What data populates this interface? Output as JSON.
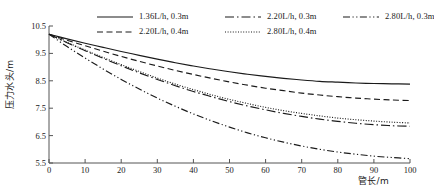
{
  "chart_data": {
    "type": "line",
    "title": "",
    "xlabel": "管长/m",
    "ylabel": "压力水头/m",
    "xlim": [
      0,
      100
    ],
    "ylim": [
      5.5,
      10.5
    ],
    "xticks": [
      0,
      10,
      20,
      30,
      40,
      50,
      60,
      70,
      80,
      90,
      100
    ],
    "yticks": [
      "10.5",
      "9.5",
      "8.5",
      "7.5",
      "6.5",
      "5.5"
    ],
    "grid": false,
    "legend_position": "top",
    "x": [
      0,
      5,
      10,
      15,
      20,
      25,
      30,
      35,
      40,
      45,
      50,
      55,
      60,
      65,
      70,
      75,
      80,
      85,
      90,
      95,
      100
    ],
    "series": [
      {
        "name": "1.36L/h, 0.3m",
        "style": "solid",
        "color": "#1a1a1a",
        "values": [
          10.2,
          10.03,
          9.87,
          9.72,
          9.57,
          9.43,
          9.29,
          9.16,
          9.04,
          8.93,
          8.83,
          8.74,
          8.66,
          8.59,
          8.53,
          8.48,
          8.45,
          8.42,
          8.4,
          8.39,
          8.38
        ]
      },
      {
        "name": "2.20L/h, 0.4m",
        "style": "dashed",
        "color": "#1a1a1a",
        "values": [
          10.2,
          9.98,
          9.78,
          9.58,
          9.39,
          9.21,
          9.04,
          8.88,
          8.73,
          8.59,
          8.46,
          8.34,
          8.23,
          8.14,
          8.05,
          7.98,
          7.92,
          7.87,
          7.83,
          7.8,
          7.78
        ]
      },
      {
        "name": "2.20L/h, 0.3m",
        "style": "dash-dot",
        "color": "#1a1a1a",
        "values": [
          10.2,
          9.89,
          9.6,
          9.32,
          9.05,
          8.79,
          8.55,
          8.32,
          8.11,
          7.92,
          7.74,
          7.58,
          7.44,
          7.31,
          7.2,
          7.1,
          7.02,
          6.95,
          6.9,
          6.86,
          6.84
        ]
      },
      {
        "name": "2.80L/h, 0.4m",
        "style": "dotted",
        "color": "#1a1a1a",
        "values": [
          10.2,
          9.9,
          9.62,
          9.35,
          9.09,
          8.84,
          8.6,
          8.38,
          8.18,
          7.99,
          7.82,
          7.67,
          7.53,
          7.41,
          7.31,
          7.22,
          7.14,
          7.08,
          7.03,
          6.99,
          6.96
        ]
      },
      {
        "name": "2.80L/h, 0.3m",
        "style": "dash-dot-dot",
        "color": "#1a1a1a",
        "values": [
          10.2,
          9.75,
          9.33,
          8.93,
          8.55,
          8.2,
          7.87,
          7.57,
          7.29,
          7.04,
          6.81,
          6.6,
          6.42,
          6.26,
          6.12,
          6.0,
          5.9,
          5.82,
          5.75,
          5.7,
          5.66
        ]
      }
    ],
    "legend": [
      {
        "label": "1.36L/h, 0.3m",
        "style": "solid"
      },
      {
        "label": "2.20L/h, 0.3m",
        "style": "dash-dot"
      },
      {
        "label": "2.80L/h, 0.3m",
        "style": "dash-dot-dot"
      },
      {
        "label": "2.20L/h, 0.4m",
        "style": "dashed"
      },
      {
        "label": "2.80L/h, 0.4m",
        "style": "dotted"
      }
    ],
    "legend_rows": [
      [
        "1.36L/h, 0.3m",
        "2.20L/h, 0.3m",
        "2.80L/h, 0.3m"
      ],
      [
        "2.20L/h, 0.4m",
        "2.80L/h, 0.4m"
      ]
    ],
    "axis_color": "#555555"
  }
}
